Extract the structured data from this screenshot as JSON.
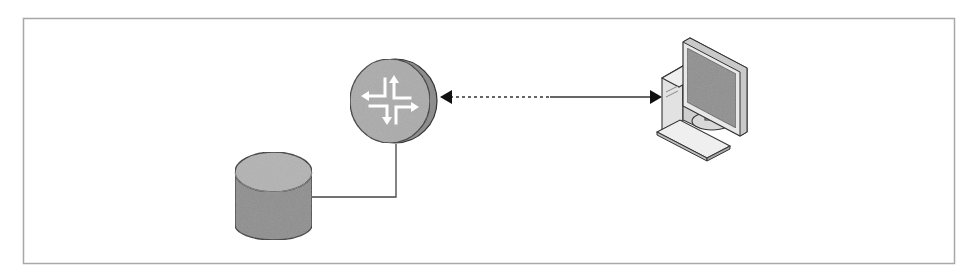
{
  "diagram": {
    "type": "network-topology",
    "frame": {
      "x": 23,
      "y": 18,
      "width": 931,
      "height": 245,
      "stroke": "#a8a8a8"
    },
    "nodes": [
      {
        "id": "router",
        "kind": "router",
        "icon": "router-icon",
        "cx": 391,
        "cy": 102,
        "r": 42,
        "fill": "#a9a9a9",
        "edge": "#7f7f7f"
      },
      {
        "id": "storage",
        "kind": "database",
        "icon": "database-cylinder-icon",
        "x": 235,
        "y": 152,
        "width": 77,
        "height": 88,
        "top_fill": "#b2b2b2",
        "body_fill": "#8c8c8c"
      },
      {
        "id": "workstation",
        "kind": "computer",
        "icon": "desktop-computer-icon",
        "x": 655,
        "y": 36,
        "width": 95,
        "height": 125
      }
    ],
    "edges": [
      {
        "from": "router",
        "to": "storage",
        "style": "solid",
        "arrows": "none"
      },
      {
        "from": "router",
        "to": "workstation",
        "style": "dotted-then-solid",
        "arrows": "both",
        "dotted_segment": [
          448,
          550
        ],
        "solid_segment": [
          550,
          652
        ],
        "y": 97
      }
    ],
    "labels": []
  }
}
